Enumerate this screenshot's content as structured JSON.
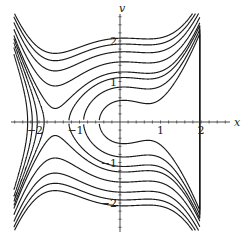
{
  "figure": {
    "type": "phase-portrait",
    "x_axis_label": "x",
    "y_axis_label": "v",
    "x_ticks": [
      {
        "value": -2,
        "label": "−2"
      },
      {
        "value": -1,
        "label": "−1"
      },
      {
        "value": 1,
        "label": "1"
      },
      {
        "value": 2,
        "label": "2"
      }
    ],
    "y_ticks": [
      {
        "value": 2,
        "label": "2"
      },
      {
        "value": 1,
        "label": "1"
      },
      {
        "value": -1,
        "label": "−1"
      },
      {
        "value": -2,
        "label": "−2"
      }
    ],
    "x_range": [
      -2.75,
      2.75
    ],
    "y_range": [
      -2.8,
      2.8
    ],
    "minor_tick_step": 0.2,
    "curve_color": "#1a1a1a",
    "axis_color": "#333333",
    "potential_roots": [
      -1.6,
      0.1,
      0.69
    ],
    "potential_scale": 0.6,
    "clip_box": {
      "xmin": -2.62,
      "xmax": 1.97,
      "vmin": -2.68,
      "vmax": 2.68
    },
    "energy_levels": {
      "inner_c_curves": [
        0.14,
        0.37,
        0.6
      ],
      "left_curves": [
        0.6,
        0.4,
        0.17,
        -0.12
      ],
      "through_curves": [
        0.76,
        1.1,
        1.5,
        1.85,
        2.14
      ]
    }
  }
}
